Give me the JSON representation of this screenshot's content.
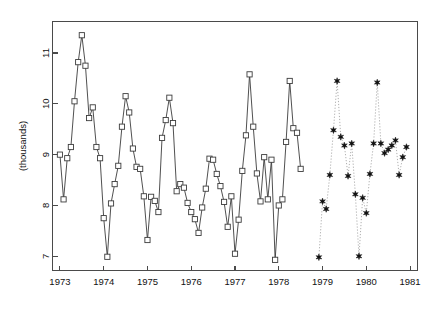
{
  "chart_data": {
    "type": "line",
    "title": "",
    "subtitle": "",
    "xlabel": "",
    "ylabel": "(thousands)",
    "xlim": [
      1972.83,
      1981.17
    ],
    "ylim": [
      6.72,
      11.62
    ],
    "grid": false,
    "legend": null,
    "x_ticks": [
      1973,
      1974,
      1975,
      1976,
      1977,
      1978,
      1979,
      1980,
      1981
    ],
    "x_tick_labels": [
      "1973",
      "1974",
      "1975",
      "1976",
      "1977",
      "1978",
      "1979",
      "1980",
      "1981"
    ],
    "y_ticks": [
      7,
      8,
      9,
      10,
      11
    ],
    "y_tick_labels": [
      "7",
      "8",
      "9",
      "10",
      "11"
    ],
    "series": [
      {
        "name": "observed",
        "marker": "open-square",
        "linestyle": "solid",
        "color": "#3c3c3c",
        "x": [
          1973.0,
          1973.083,
          1973.167,
          1973.25,
          1973.333,
          1973.417,
          1973.5,
          1973.583,
          1973.667,
          1973.75,
          1973.833,
          1973.917,
          1974.0,
          1974.083,
          1974.167,
          1974.25,
          1974.333,
          1974.417,
          1974.5,
          1974.583,
          1974.667,
          1974.75,
          1974.833,
          1974.917,
          1975.0,
          1975.083,
          1975.167,
          1975.25,
          1975.333,
          1975.417,
          1975.5,
          1975.583,
          1975.667,
          1975.75,
          1975.833,
          1975.917,
          1976.0,
          1976.083,
          1976.167,
          1976.25,
          1976.333,
          1976.417,
          1976.5,
          1976.583,
          1976.667,
          1976.75,
          1976.833,
          1976.917,
          1977.0,
          1977.083,
          1977.167,
          1977.25,
          1977.333,
          1977.417,
          1977.5,
          1977.583,
          1977.667,
          1977.75,
          1977.833,
          1977.917,
          1978.0,
          1978.083,
          1978.167,
          1978.25,
          1978.333,
          1978.417,
          1978.5
        ],
        "y": [
          9.0,
          8.12,
          8.93,
          9.15,
          10.05,
          10.82,
          11.35,
          10.75,
          9.72,
          9.93,
          9.15,
          8.93,
          7.75,
          6.99,
          8.04,
          8.42,
          8.78,
          9.55,
          10.15,
          9.83,
          9.12,
          8.76,
          8.72,
          8.18,
          7.32,
          8.17,
          8.09,
          7.87,
          9.33,
          9.68,
          10.12,
          9.62,
          8.28,
          8.42,
          8.35,
          8.05,
          7.87,
          7.73,
          7.46,
          7.96,
          8.33,
          8.92,
          8.9,
          8.62,
          8.38,
          8.07,
          7.58,
          8.18,
          7.05,
          7.72,
          8.68,
          9.38,
          10.58,
          9.55,
          8.63,
          8.08,
          8.95,
          8.12,
          8.9,
          6.93,
          8.0,
          8.12,
          9.25,
          10.45,
          9.52,
          9.43,
          8.72
        ]
      },
      {
        "name": "forecast",
        "marker": "filled-star",
        "linestyle": "dotted",
        "color": "#111111",
        "x": [
          1978.917,
          1979.0,
          1979.083,
          1979.167,
          1979.25,
          1979.333,
          1979.417,
          1979.5,
          1979.583,
          1979.667,
          1979.75,
          1979.833,
          1979.917,
          1980.0,
          1980.083,
          1980.167,
          1980.25,
          1980.333,
          1980.417,
          1980.5,
          1980.583,
          1980.667,
          1980.75,
          1980.833,
          1980.917
        ],
        "y": [
          6.98,
          8.08,
          7.93,
          8.6,
          9.48,
          10.45,
          9.35,
          9.18,
          8.58,
          9.22,
          8.22,
          7.0,
          8.15,
          7.85,
          8.62,
          9.22,
          10.42,
          9.22,
          9.03,
          9.1,
          9.18,
          9.28,
          8.6,
          8.95,
          9.15
        ]
      }
    ]
  },
  "axes": {
    "y_axis_label": "(thousands)"
  }
}
